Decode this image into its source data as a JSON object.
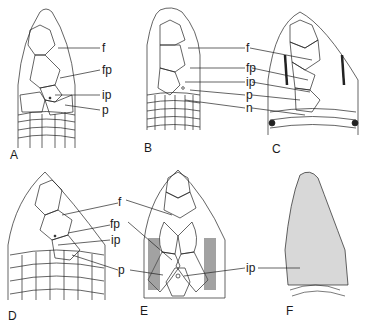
{
  "figure": {
    "panels": [
      {
        "id": "A",
        "label": "A",
        "scale_labels": [
          "f",
          "fp",
          "ip",
          "p"
        ]
      },
      {
        "id": "B",
        "label": "B",
        "scale_labels": [
          "f",
          "fp",
          "ip",
          "p",
          "n"
        ]
      },
      {
        "id": "C",
        "label": "C",
        "scale_labels": [
          "f",
          "fp",
          "ip",
          "p",
          "n"
        ]
      },
      {
        "id": "D",
        "label": "D",
        "scale_labels": [
          "f",
          "fp",
          "ip",
          "p"
        ]
      },
      {
        "id": "E",
        "label": "E",
        "scale_labels": [
          "f",
          "fp",
          "p"
        ]
      },
      {
        "id": "F",
        "label": "F",
        "scale_labels": [
          "ip"
        ]
      }
    ],
    "labels": {
      "f": "f",
      "fp": "fp",
      "ip": "ip",
      "p": "p",
      "n": "n"
    },
    "colors": {
      "ink": "#1a1a1a",
      "background": "#ffffff"
    }
  }
}
